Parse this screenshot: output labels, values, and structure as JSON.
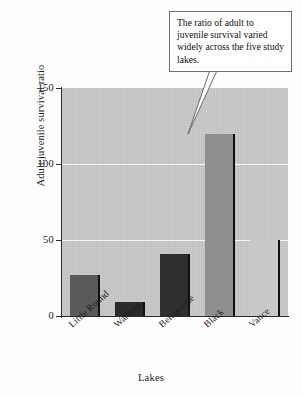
{
  "chart_data": {
    "type": "bar",
    "title": "",
    "xlabel": "Lakes",
    "ylabel": "Adult:juvenile survival ratio",
    "categories": [
      "Little Round",
      "Warrens",
      "Beloporine",
      "Black",
      "Vance"
    ],
    "values": [
      27,
      9,
      41,
      120,
      50
    ],
    "bar_colors": [
      "#5a5a5a",
      "#2b2b2b",
      "#2f2f2f",
      "#8f8f8f",
      "#c9c9c9"
    ],
    "ylim": [
      0,
      150
    ],
    "yticks": [
      0,
      50,
      100,
      150
    ],
    "ytick_labels": [
      "0",
      "50",
      "100",
      "150"
    ],
    "gridlines": [
      50,
      100
    ],
    "grid": true,
    "grid_color": "#f2f2f2",
    "plot_background": "#c9c9c9",
    "legend": null,
    "annotations": [
      {
        "text": "The ratio of adult to juvenile survival varied widely across the five study lakes.",
        "points_to": "Black"
      }
    ]
  },
  "axis": {
    "y_title": "Adult:juvenile survival ratio",
    "x_title": "Lakes",
    "ticks": [
      {
        "label": "150",
        "value": 150
      },
      {
        "label": "100",
        "value": 100
      },
      {
        "label": "50",
        "value": 50
      },
      {
        "label": "0",
        "value": 0
      }
    ]
  },
  "callout": {
    "text": "The ratio of adult to juvenile survival varied widely across the five study lakes."
  },
  "colors": {
    "plot_bg": "#c9c9c9",
    "grid": "#f2f2f2",
    "axis": "#2b2b2b",
    "callout_border": "#6f6f6f",
    "callout_bg": "#ffffff"
  }
}
